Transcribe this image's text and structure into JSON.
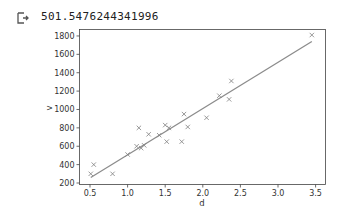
{
  "output": {
    "icon": "output-arrow-icon",
    "text": "501.5476244341996"
  },
  "chart_data": {
    "type": "scatter",
    "title": "",
    "xlabel": "d",
    "ylabel": "v",
    "xlim": [
      0.4,
      3.6
    ],
    "ylim": [
      180,
      1880
    ],
    "grid": false,
    "legend": null,
    "xticks": [
      0.5,
      1.0,
      1.5,
      2.0,
      2.5,
      3.0,
      3.5
    ],
    "xtick_labels": [
      "0.5",
      "1.0",
      "1.5",
      "2.0",
      "2.5",
      "3.0",
      "3.5"
    ],
    "yticks": [
      200,
      400,
      600,
      800,
      1000,
      1200,
      1400,
      1600,
      1800
    ],
    "ytick_labels": [
      "200",
      "400",
      "600",
      "800",
      "1000",
      "1200",
      "1400",
      "1600",
      "1800"
    ],
    "series": [
      {
        "name": "data",
        "marker": "x",
        "color": "#7f7f7f",
        "x": [
          0.51,
          0.55,
          0.8,
          1.0,
          1.12,
          1.15,
          1.18,
          1.22,
          1.28,
          1.42,
          1.5,
          1.52,
          1.55,
          1.72,
          1.75,
          1.8,
          2.05,
          2.22,
          2.35,
          2.38,
          3.45
        ],
        "y": [
          300,
          400,
          300,
          510,
          600,
          800,
          580,
          610,
          730,
          720,
          830,
          650,
          800,
          650,
          950,
          810,
          910,
          1150,
          1110,
          1310,
          1810
        ]
      },
      {
        "name": "fit",
        "type": "line",
        "color": "#8c8c8c",
        "x": [
          0.51,
          3.45
        ],
        "y": [
          260,
          1740
        ]
      }
    ]
  }
}
